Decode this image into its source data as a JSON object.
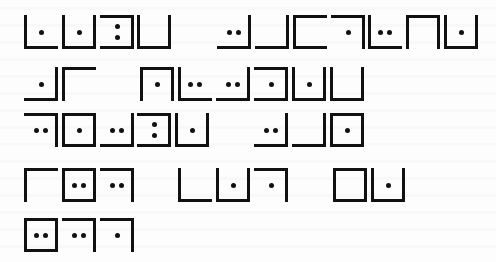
{
  "document": {
    "kind": "pigpen-style cipher glyphs",
    "colors": {
      "ink": "#111111",
      "paper": "#fdfdfd"
    },
    "glyph_encoding_note": "borders: T=top R=right B=bottom L=left; dots: 0, 1, 2h (two horizontal), 2v (two vertical)",
    "lines": [
      {
        "y": 15,
        "glyphs": [
          {
            "x": 24,
            "borders": "LB",
            "dots": "1"
          },
          {
            "x": 62,
            "borders": "LBR",
            "dots": "1"
          },
          {
            "x": 100,
            "borders": "TRB",
            "dots": "2v"
          },
          {
            "x": 137,
            "borders": "LBR",
            "dots": "0"
          },
          {
            "x": 217,
            "borders": "RB",
            "dots": "2h"
          },
          {
            "x": 255,
            "borders": "RB",
            "dots": "0"
          },
          {
            "x": 293,
            "borders": "TLB",
            "dots": "0"
          },
          {
            "x": 331,
            "borders": "TR",
            "dots": "1"
          },
          {
            "x": 368,
            "borders": "LB",
            "dots": "2h"
          },
          {
            "x": 406,
            "borders": "TLR",
            "dots": "0"
          },
          {
            "x": 444,
            "borders": "LBR",
            "dots": "1"
          }
        ]
      },
      {
        "y": 67,
        "glyphs": [
          {
            "x": 24,
            "borders": "RB",
            "dots": "1"
          },
          {
            "x": 62,
            "borders": "TL",
            "dots": "0"
          },
          {
            "x": 140,
            "borders": "TLR",
            "dots": "1"
          },
          {
            "x": 178,
            "borders": "LB",
            "dots": "2h"
          },
          {
            "x": 216,
            "borders": "RB",
            "dots": "2h"
          },
          {
            "x": 254,
            "borders": "TRB",
            "dots": "1"
          },
          {
            "x": 292,
            "borders": "LBR",
            "dots": "1"
          },
          {
            "x": 330,
            "borders": "LBR",
            "dots": "0"
          }
        ]
      },
      {
        "y": 113,
        "glyphs": [
          {
            "x": 24,
            "borders": "TR",
            "dots": "2h"
          },
          {
            "x": 62,
            "borders": "TRBL",
            "dots": "1"
          },
          {
            "x": 100,
            "borders": "RB",
            "dots": "2h"
          },
          {
            "x": 137,
            "borders": "TRB",
            "dots": "2v"
          },
          {
            "x": 175,
            "borders": "LBR",
            "dots": "1"
          },
          {
            "x": 254,
            "borders": "RB",
            "dots": "2h"
          },
          {
            "x": 292,
            "borders": "RB",
            "dots": "0"
          },
          {
            "x": 330,
            "borders": "TRBL",
            "dots": "1"
          }
        ]
      },
      {
        "y": 168,
        "glyphs": [
          {
            "x": 24,
            "borders": "TL",
            "dots": "0"
          },
          {
            "x": 62,
            "borders": "TRBL",
            "dots": "2h"
          },
          {
            "x": 100,
            "borders": "TR",
            "dots": "2h"
          },
          {
            "x": 178,
            "borders": "LB",
            "dots": "0"
          },
          {
            "x": 216,
            "borders": "LBR",
            "dots": "1"
          },
          {
            "x": 254,
            "borders": "TR",
            "dots": "1"
          },
          {
            "x": 333,
            "borders": "TRBL",
            "dots": "0"
          },
          {
            "x": 371,
            "borders": "LBR",
            "dots": "1"
          }
        ]
      },
      {
        "y": 218,
        "glyphs": [
          {
            "x": 24,
            "borders": "TRBL",
            "dots": "2h"
          },
          {
            "x": 62,
            "borders": "TR",
            "dots": "2h"
          },
          {
            "x": 100,
            "borders": "TR",
            "dots": "1"
          }
        ]
      }
    ]
  }
}
